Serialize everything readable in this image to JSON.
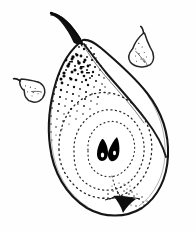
{
  "artwork": {
    "title": "Pear, halved longitudinal section with two small whole pears",
    "medium": "pen-and-ink stipple drawing",
    "subject": "pear",
    "background_color": "#fefefe",
    "ink_color": "#1a1a1a",
    "canvas": {
      "width": 196,
      "height": 231
    }
  },
  "elements": {
    "main_pear": {
      "name": "halved pear",
      "bounds": {
        "x": 48,
        "y": 12,
        "width": 122,
        "height": 206
      },
      "outline_color": "#151515",
      "fill_color": "#ffffff"
    },
    "stem": {
      "name": "stem",
      "bounds": {
        "x": 51,
        "y": 12,
        "width": 32,
        "height": 32
      },
      "color": "#101010"
    },
    "cut_face_divider": {
      "name": "cut face dividing ridge",
      "color": "#171717"
    },
    "core_outline": {
      "name": "seed core dotted outline",
      "style": "dotted",
      "rings": 3,
      "color": "#2a2a2a"
    },
    "seeds": {
      "name": "pear seeds",
      "count": 2,
      "color": "#000000",
      "positions": [
        {
          "x": 103,
          "y": 150
        },
        {
          "x": 113,
          "y": 149
        }
      ]
    },
    "blossom_end": {
      "name": "blossom end calyx",
      "bounds": {
        "x": 108,
        "y": 193,
        "width": 34,
        "height": 24
      },
      "color": "#0d0d0d"
    },
    "stipple_texture": {
      "name": "stipple shading on skin",
      "region": "upper left shoulder",
      "color": "#111111",
      "dot_count": 430
    },
    "small_pear_left": {
      "name": "small pear sketch (left)",
      "bounds": {
        "x": 14,
        "y": 74,
        "width": 32,
        "height": 32
      },
      "rotation_deg": -38,
      "outline_color": "#262626"
    },
    "small_pear_right": {
      "name": "small pear sketch (right)",
      "bounds": {
        "x": 127,
        "y": 29,
        "width": 31,
        "height": 38
      },
      "rotation_deg": 10,
      "outline_color": "#262626"
    }
  }
}
